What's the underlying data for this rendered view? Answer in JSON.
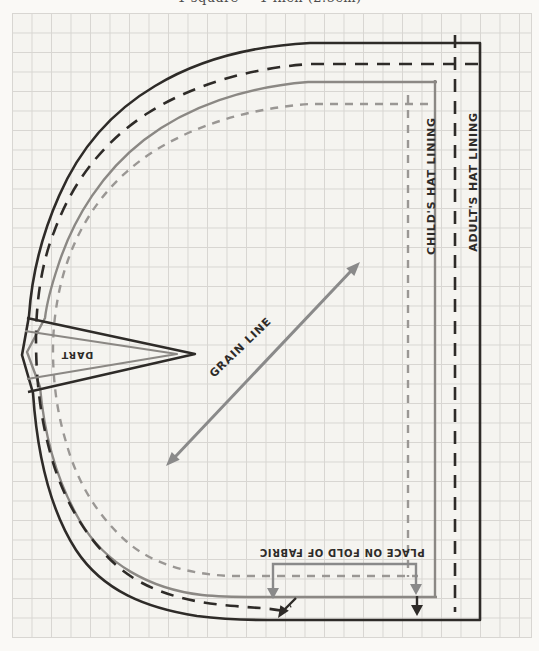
{
  "caption": {
    "scale_note": "1 square = 1 inch (2.5cm)"
  },
  "labels": {
    "child_lining": "CHILD'S HAT LINING",
    "adult_lining": "ADULT'S HAT LINING",
    "grain_line": "GRAIN LINE",
    "dart": "DART",
    "place_on_fold": "PLACE ON FOLD OF FABRIC"
  },
  "lines": {
    "adult_pattern": {
      "style": "solid",
      "color": "#2e2b28"
    },
    "adult_lining": {
      "style": "dashed",
      "color": "#2e2b28"
    },
    "child_pattern": {
      "style": "solid",
      "color": "#8b8884"
    },
    "child_lining": {
      "style": "dashed",
      "color": "#9a9794"
    }
  },
  "colors": {
    "adult_line": "#2e2b28",
    "child_line": "#8b8884",
    "marking_gray": "#8a8a8a",
    "grid_line": "#d8d6d2",
    "grid_paper": "#f5f4f0",
    "page": "#faf9f6"
  }
}
